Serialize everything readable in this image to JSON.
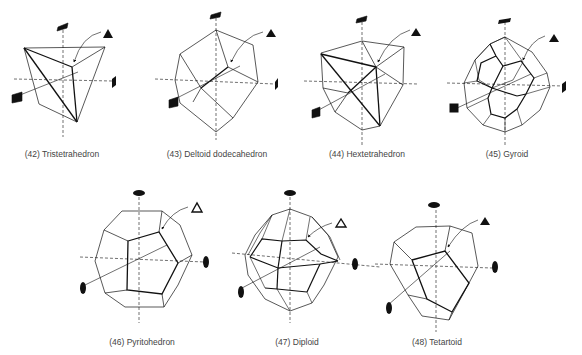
{
  "figures": [
    {
      "number": "(42)",
      "name": "Tristetrahedron",
      "caption": "(42) Tristetrahedron",
      "cx": 62,
      "cy": 155
    },
    {
      "number": "(43)",
      "name": "Deltoid dodecahedron",
      "caption": "(43) Deltoid dodecahedron",
      "cx": 217,
      "cy": 155
    },
    {
      "number": "(44)",
      "name": "Hextetrahedron",
      "caption": "(44) Hextetrahedron",
      "cx": 367,
      "cy": 155
    },
    {
      "number": "(45)",
      "name": "Gyroid",
      "caption": "(45) Gyroid",
      "cx": 507,
      "cy": 155
    },
    {
      "number": "(46)",
      "name": "Pyritohedron",
      "caption": "(46) Pyritohedron",
      "cx": 142,
      "cy": 343
    },
    {
      "number": "(47)",
      "name": "Diploid",
      "caption": "(47) Diploid",
      "cx": 297,
      "cy": 343
    },
    {
      "number": "(48)",
      "name": "Tetartoid",
      "caption": "(48) Tetartoid",
      "cx": 437,
      "cy": 343
    }
  ],
  "symbols": {
    "filled_triangle": "3-fold rotoinversion axis (filled triangle)",
    "open_triangle": "3-fold axis with inversion (open triangle)",
    "half_square": "4-fold rotoinversion axis",
    "filled_square": "4-fold rotation axis",
    "filled_ellipse": "2-fold rotation axis"
  }
}
